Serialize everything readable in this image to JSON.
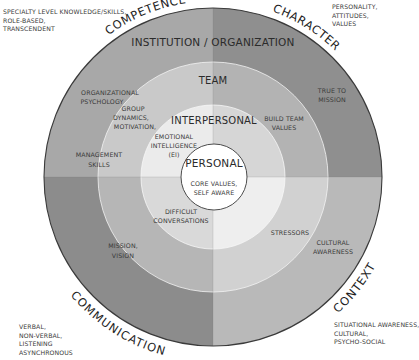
{
  "diagram": {
    "center": {
      "x": 213,
      "y": 177
    },
    "radii": {
      "outer": 169,
      "team": 115,
      "interpersonal": 72,
      "personal": 33
    },
    "colors": {
      "outer": {
        "tl": "#a8a8a8",
        "tr": "#8f8f8f",
        "bl": "#8c8c8c",
        "br": "#b9b9b9"
      },
      "team": {
        "tl": "#c9c9c9",
        "tr": "#b3b3b3",
        "bl": "#b6b6b6",
        "br": "#d1d1d1"
      },
      "interpersonal": {
        "tl": "#ebebeb",
        "tr": "#d6d6d6",
        "bl": "#d9d9d9",
        "br": "#eeeeee"
      },
      "personal": "#ffffff",
      "border": "#3a3a3a"
    },
    "rings": {
      "institution": "INSTITUTION / ORGANIZATION",
      "team": "TEAM",
      "interpersonal": "INTERPERSONAL",
      "personal": "PERSONAL"
    },
    "quadrants": {
      "competence": "COMPETENCE",
      "character": "CHARACTER",
      "communication": "COMMUNICATION",
      "context": "CONTEXT"
    },
    "items": {
      "organizational_psychology": [
        "ORGANIZATIONAL",
        "PSYCHOLOGY"
      ],
      "management_skills": [
        "MANAGEMENT",
        "SKILLS"
      ],
      "group_dynamics": [
        "GROUP",
        "DYNAMICS,",
        "MOTIVATION,"
      ],
      "emotional_intelligence": [
        "EMOTIONAL",
        "INTELLIGENCE",
        "(EI)"
      ],
      "true_to_mission": [
        "TRUE TO",
        "MISSION"
      ],
      "build_team_values": [
        "BUILD TEAM",
        "VALUES"
      ],
      "core_values": [
        "CORE VALUES,",
        "SELF AWARE"
      ],
      "difficult_conversations": [
        "DIFFICULT",
        "CONVERSATIONS"
      ],
      "mission_vision": [
        "MISSION,",
        "VISION"
      ],
      "stressors": [
        "STRESSORS"
      ],
      "cultural_awareness": [
        "CULTURAL",
        "AWARENESS"
      ]
    }
  },
  "notes": {
    "top_left": [
      "SPECIALTY LEVEL KNOWLEDGE/SKILLS,",
      "ROLE-BASED,",
      "TRANSCENDENT"
    ],
    "top_right": [
      "PERSONALITY,",
      "ATTITUDES,",
      "VALUES"
    ],
    "bottom_left": [
      "VERBAL,",
      "NON-VERBAL,",
      "LISTENING",
      "ASYNCHRONOUS"
    ],
    "bottom_right": [
      "SITUATIONAL AWARENESS,",
      "CULTURAL,",
      "PSYCHO-SOCIAL"
    ]
  }
}
